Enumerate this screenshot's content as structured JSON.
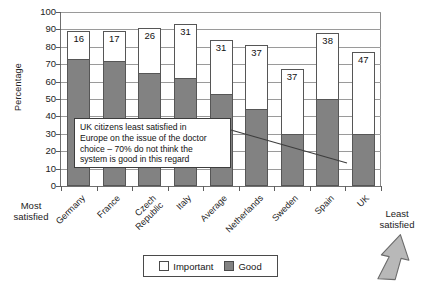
{
  "chart_data": {
    "type": "bar",
    "title": "",
    "subtitle": "",
    "xlabel": "",
    "ylabel": "Percentage",
    "ylim": [
      0,
      100
    ],
    "y_ticks": [
      0,
      10,
      20,
      30,
      40,
      50,
      60,
      70,
      80,
      90,
      100
    ],
    "grid": true,
    "legend_position": "bottom-center",
    "categories": [
      "Germany",
      "France",
      "Czech\nRepublic",
      "Italy",
      "Average",
      "Netherlands",
      "Sweden",
      "Spain",
      "UK"
    ],
    "series": [
      {
        "name": "Important",
        "color": "#ffffff",
        "values": [
          89,
          89,
          91,
          93,
          84,
          81,
          67,
          88,
          77
        ]
      },
      {
        "name": "Good",
        "color": "#828282",
        "values": [
          73,
          72,
          65,
          62,
          53,
          44,
          30,
          50,
          30
        ]
      }
    ],
    "gap_labels": [
      16,
      17,
      26,
      31,
      31,
      37,
      37,
      38,
      47
    ],
    "annotations": [
      {
        "name": "callout",
        "text": "UK citizens least satisfied in\nEurope on the issue of the doctor\nchoice – 70% do not think the\nsystem is good in this regard"
      }
    ],
    "axis_end_labels": {
      "left": "Most\nsatisfied",
      "right": "Least\nsatisfied"
    }
  },
  "legend": {
    "entries": [
      {
        "label": "Important",
        "swatch": "white-square"
      },
      {
        "label": "Good",
        "swatch": "gray-square"
      }
    ]
  },
  "colors": {
    "bar_good": "#828282",
    "bar_important": "#ffffff",
    "bar_outline": "#565656",
    "gridline": "#9a9a9a",
    "axis": "#6f6f6f",
    "text": "#1a1a1a",
    "arrow_fill": "#b4b4b4",
    "arrow_outline": "#6b6b6b"
  },
  "arrow": {
    "name": "up-arrow-highlight",
    "points_to": "UK"
  }
}
